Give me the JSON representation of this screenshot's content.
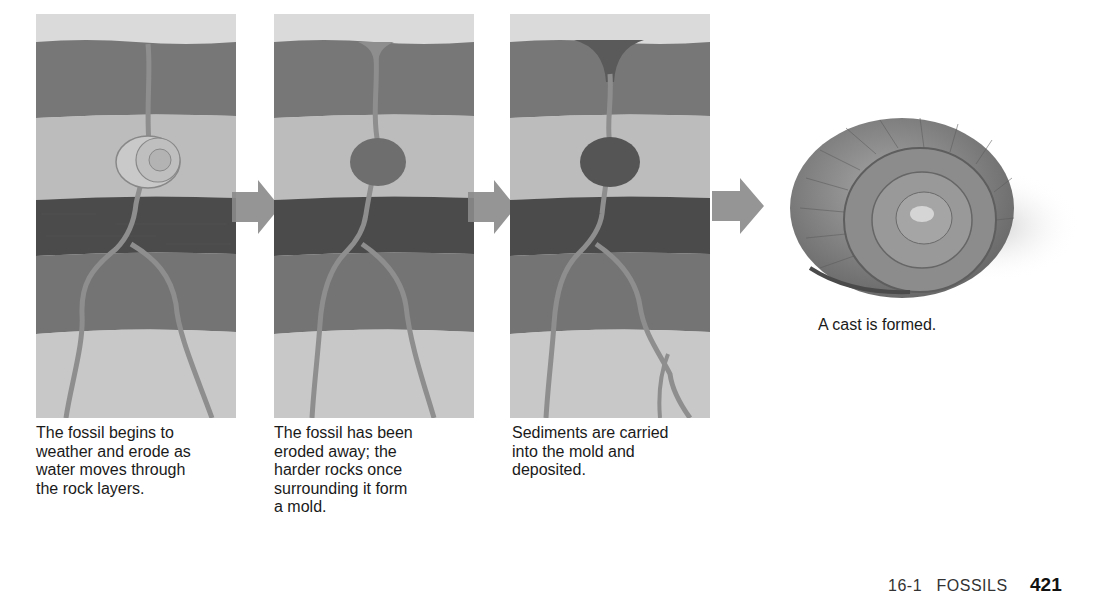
{
  "stages": [
    {
      "caption": "The fossil begins to weather and erode as water moves through the rock layers.",
      "lines": [
        "The fossil begins to",
        "weather and erode as",
        "water moves through",
        "the rock layers."
      ]
    },
    {
      "caption": "The fossil has been eroded away; the harder rocks once surrounding it form a mold.",
      "lines": [
        "The fossil has been",
        "eroded away; the",
        "harder rocks once",
        "surrounding it form",
        "a mold."
      ]
    },
    {
      "caption": "Sediments are carried into the mold and deposited.",
      "lines": [
        "Sediments are carried",
        "into the mold and",
        "deposited."
      ]
    }
  ],
  "cast": {
    "caption": "A cast is formed."
  },
  "footer": {
    "section": "16-1",
    "section_title": "FOSSILS",
    "page_number": "421"
  },
  "colors": {
    "sky": "#d9d9d9",
    "top_layer": "#7a7a7a",
    "light_layer": "#bdbdbd",
    "dark_layer": "#4e4e4e",
    "mid_layer": "#777777",
    "bottom_layer": "#c7c7c7",
    "crack": "#8c8c8c",
    "arrow": "#8a8a8a"
  },
  "icons": {
    "arrow": "right-arrow-icon",
    "fossil": "ammonite-icon"
  }
}
